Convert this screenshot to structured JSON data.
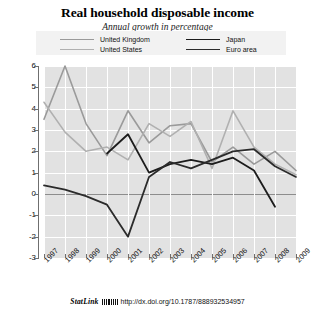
{
  "header": {
    "title": "Real household disposable income",
    "subtitle": "Annual growth in percentage"
  },
  "legend": {
    "items": [
      {
        "label": "United Kingdom",
        "color": "#9a9a9a",
        "width": 1.6
      },
      {
        "label": "United States",
        "color": "#b0b0b0",
        "width": 1.6
      },
      {
        "label": "Japan",
        "color": "#1c1c1c",
        "width": 1.8
      },
      {
        "label": "Euro area",
        "color": "#2b2b2b",
        "width": 1.8
      }
    ]
  },
  "footer": {
    "statlink": "StatLink",
    "barcode": "barcode-glyph",
    "doi": "http://dx.doi.org/10.1787/888932534957"
  },
  "chart_data": {
    "type": "line",
    "title": "Real household disposable income",
    "subtitle": "Annual growth in percentage",
    "xlabel": "",
    "ylabel": "",
    "grid": true,
    "legend_position": "top",
    "x": [
      1997,
      1998,
      1999,
      2000,
      2001,
      2002,
      2003,
      2004,
      2005,
      2006,
      2007,
      2008,
      2009
    ],
    "categories": [
      "1997",
      "1998",
      "1999",
      "2000",
      "2001",
      "2002",
      "2003",
      "2004",
      "2005",
      "2006",
      "2007",
      "2008",
      "2009"
    ],
    "xlim": [
      1997,
      2009
    ],
    "ylim": [
      -3,
      6
    ],
    "yticks": [
      6,
      5,
      4,
      3,
      2,
      1,
      0,
      -1,
      -2,
      -3
    ],
    "series": [
      {
        "name": "United Kingdom",
        "color": "#9a9a9a",
        "values": [
          3.5,
          6.0,
          3.3,
          1.8,
          3.9,
          2.4,
          3.2,
          3.3,
          1.5,
          2.2,
          1.4,
          2.0,
          1.1
        ]
      },
      {
        "name": "United States",
        "color": "#b0b0b0",
        "values": [
          4.3,
          2.9,
          2.0,
          2.2,
          1.6,
          3.3,
          2.7,
          3.4,
          1.2,
          3.9,
          2.2,
          1.4,
          0.9
        ]
      },
      {
        "name": "Japan",
        "color": "#1c1c1c",
        "values": [
          null,
          null,
          null,
          1.9,
          2.8,
          1.0,
          1.4,
          1.6,
          1.4,
          1.7,
          1.1,
          -0.6,
          null
        ]
      },
      {
        "name": "Euro area",
        "color": "#2b2b2b",
        "values": [
          0.4,
          0.2,
          -0.1,
          -0.5,
          -2.0,
          0.8,
          1.5,
          1.2,
          1.6,
          2.0,
          2.1,
          1.3,
          0.8
        ]
      }
    ]
  }
}
